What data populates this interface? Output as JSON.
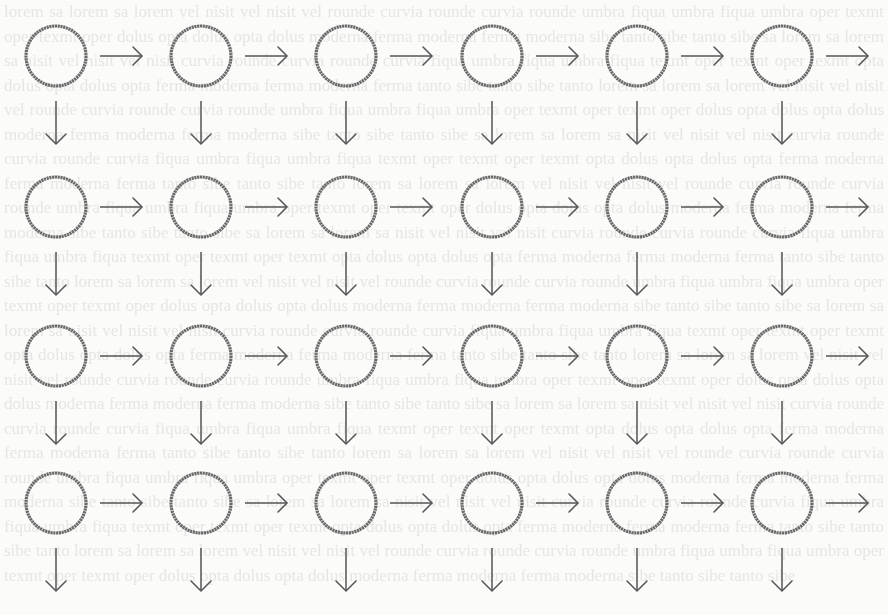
{
  "diagram": {
    "type": "grid-lattice",
    "rows": 4,
    "columns": 6,
    "node_shape": "circle",
    "node_label": "",
    "edges": {
      "horizontal": "right-arrow after every node",
      "vertical": "down-arrow below every node"
    },
    "node_radius": 30,
    "column_centers_x": [
      56,
      201,
      346,
      492,
      637,
      782
    ],
    "row_centers_y": [
      56,
      207,
      356,
      503
    ],
    "colors": {
      "node_stroke": "#6a6a6a",
      "arrow": "#555555",
      "background": "#fbfbfa"
    }
  },
  "background_text": {
    "description": "faint bleed-through text from reverse side of page, illegible"
  }
}
